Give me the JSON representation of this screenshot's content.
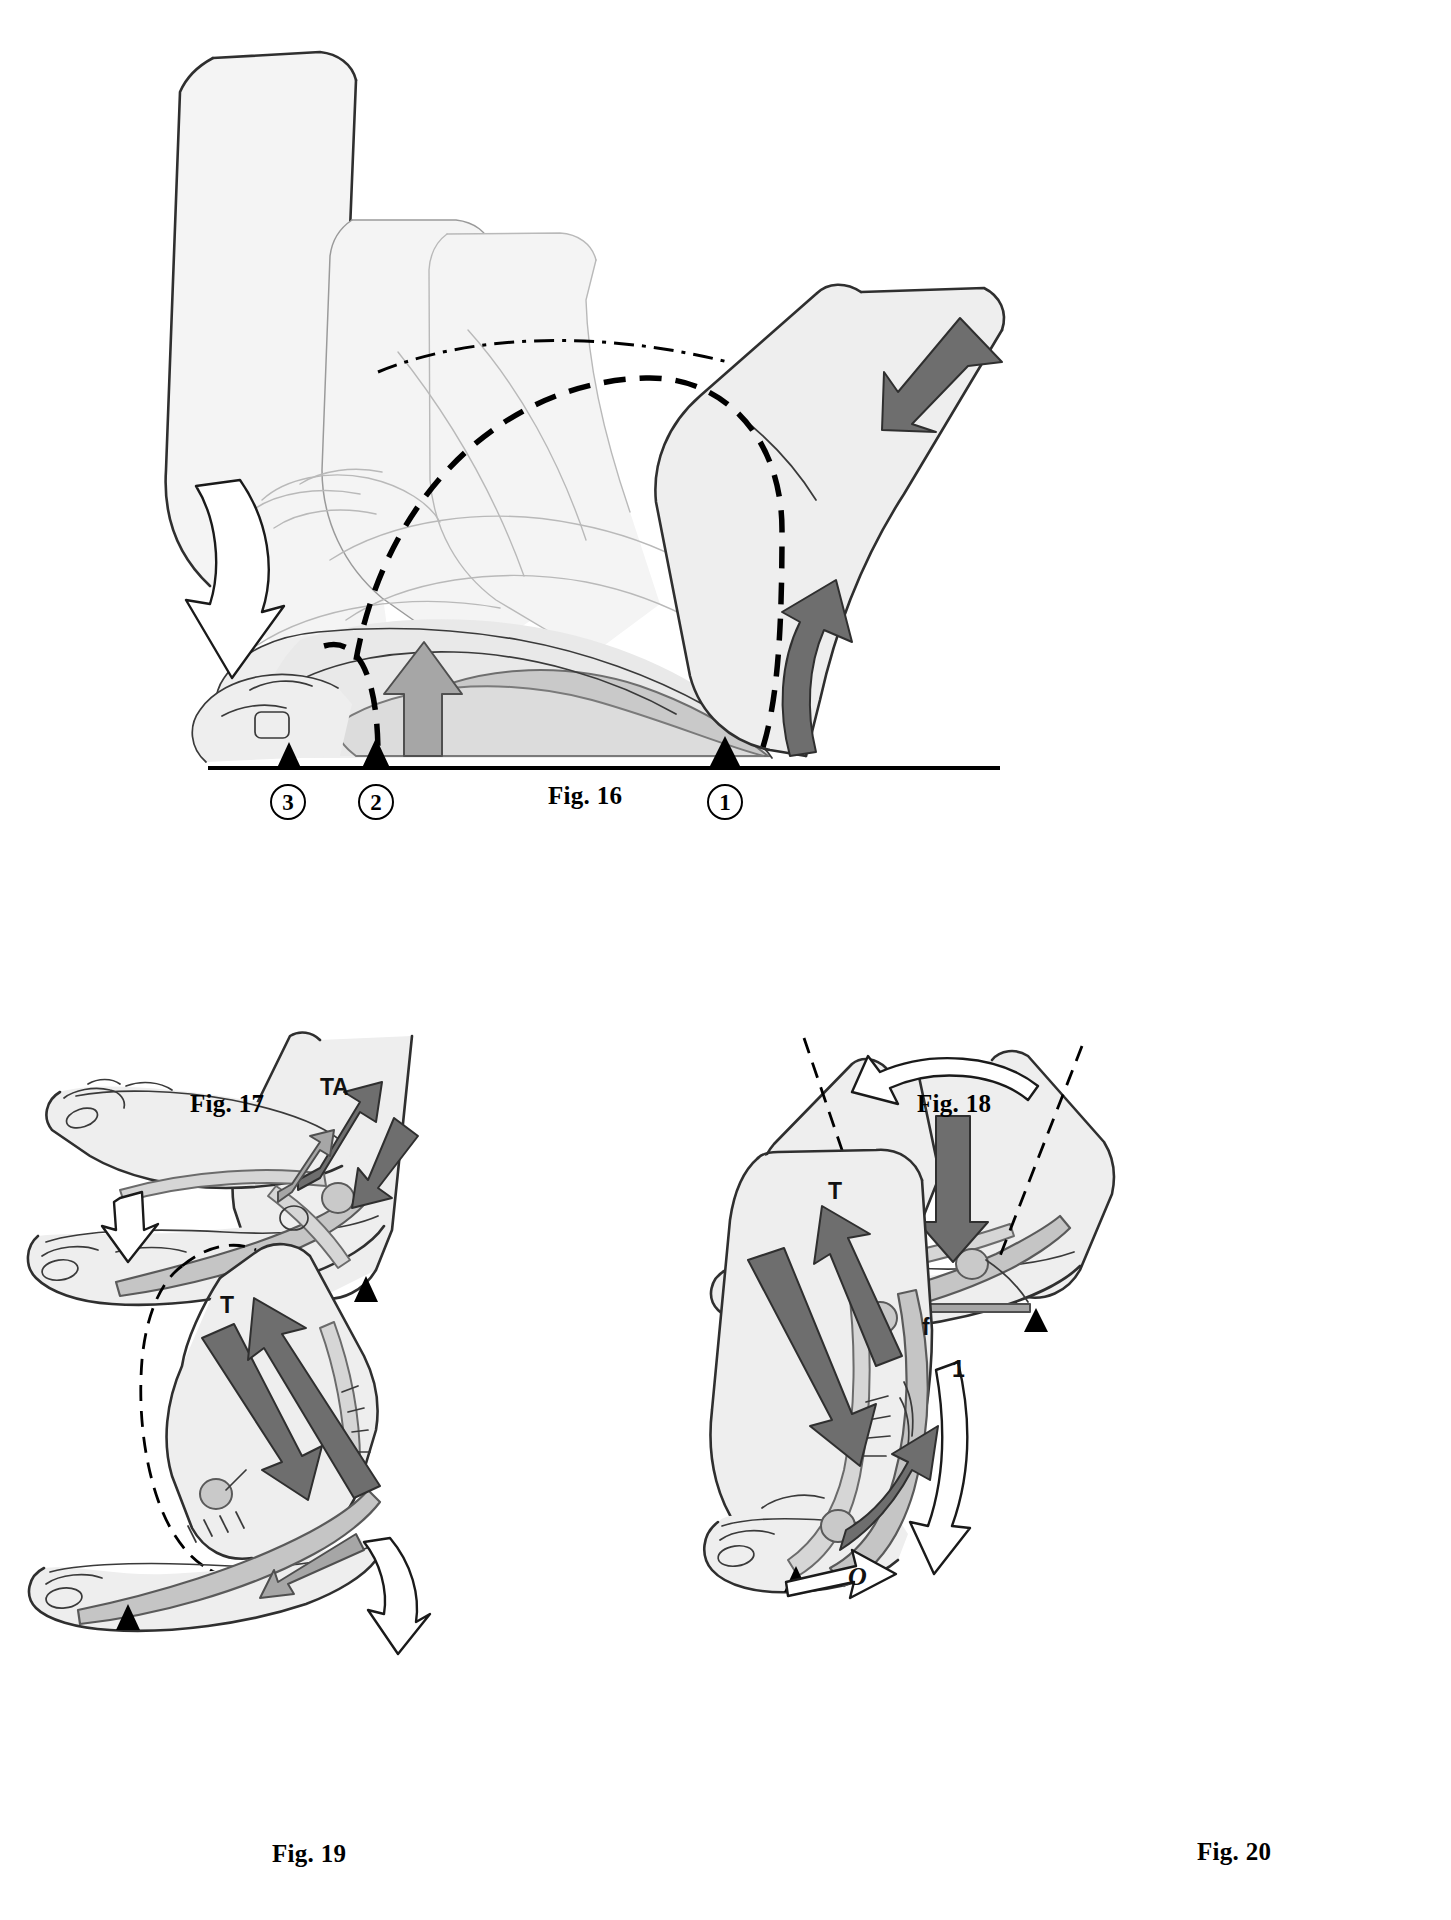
{
  "plate": {
    "title": "Foot and ankle biomechanics figure plate",
    "background_color": "#ffffff",
    "accent_dark": "#6e6e6e",
    "accent_mid": "#a6a6a6",
    "ink": "#000000"
  },
  "figures": [
    {
      "id": "fig16",
      "caption": "Fig. 16",
      "description": "Sagittal view of the foot rolling through stance with three superimposed leg positions, dashed rotation arcs and three ground contact markers",
      "ground_markers": [
        {
          "label": "3",
          "position": "forefoot-toes"
        },
        {
          "label": "2",
          "position": "metatarsal-heads"
        },
        {
          "label": "1",
          "position": "heel"
        }
      ],
      "arrows": [
        {
          "name": "plantarflexion-hollow-arrow",
          "style": "hollow",
          "direction": "down-left"
        },
        {
          "name": "tibial-advance-dark-arrow",
          "style": "dark",
          "direction": "down-left"
        },
        {
          "name": "heel-rise-dark-arrow",
          "style": "dark",
          "direction": "up"
        },
        {
          "name": "arch-lift-mid-arrow",
          "style": "mid",
          "direction": "up"
        }
      ],
      "arcs": [
        {
          "name": "upper-rotation-arc",
          "style": "dash-dot"
        },
        {
          "name": "lower-rotation-arc",
          "style": "dashed"
        },
        {
          "name": "forefoot-rotation-arc",
          "style": "dashed"
        }
      ]
    },
    {
      "id": "fig17",
      "caption": "Fig. 17",
      "description": "Foot in dorsiflexion with tibialis anterior traction, arch tie shown, hollow arrow at forefoot",
      "labels": [
        {
          "text": "TA",
          "name": "tibialis-anterior-label"
        }
      ],
      "ground_markers": [
        {
          "label": "",
          "position": "heel"
        }
      ],
      "arrows": [
        {
          "name": "tibialis-anterior-pull-arrow",
          "style": "dark",
          "direction": "up-right"
        },
        {
          "name": "tibialis-anterior-reaction-arrow",
          "style": "dark",
          "direction": "down-right"
        },
        {
          "name": "arch-tension-arrow",
          "style": "mid",
          "direction": "up-right"
        },
        {
          "name": "forefoot-descent-arrow",
          "style": "hollow",
          "direction": "down"
        }
      ]
    },
    {
      "id": "fig18",
      "caption": "Fig. 18",
      "description": "Two superimposed leg positions with dash-dot axes, body-weight load arrow descending onto talus, splay arrows at the sole",
      "labels": [],
      "ground_markers": [
        {
          "label": "",
          "position": "forefoot"
        },
        {
          "label": "",
          "position": "heel"
        }
      ],
      "arrows": [
        {
          "name": "leg-rotation-hollow-arrow",
          "style": "hollow",
          "direction": "curved-left"
        },
        {
          "name": "body-weight-load-arrow",
          "style": "dark",
          "direction": "down"
        },
        {
          "name": "arch-support-arrow",
          "style": "mid",
          "direction": "up"
        },
        {
          "name": "forefoot-splay-arrow",
          "style": "mid",
          "direction": "left-right"
        },
        {
          "name": "heel-splay-arrow",
          "style": "mid",
          "direction": "left"
        }
      ],
      "axes": [
        {
          "name": "leg-axis-left",
          "style": "dash-dot"
        },
        {
          "name": "leg-axis-right",
          "style": "dash-dot"
        }
      ]
    },
    {
      "id": "fig19",
      "caption": "Fig. 19",
      "description": "Heel-rise phase, triceps surae traction arrow T with dashed outline of the previous leg position and hollow rotation arrow behind the heel",
      "labels": [
        {
          "text": "T",
          "name": "triceps-surae-label"
        }
      ],
      "ground_markers": [
        {
          "label": "",
          "position": "forefoot"
        }
      ],
      "arrows": [
        {
          "name": "triceps-surae-pull-arrow",
          "style": "dark",
          "direction": "down-right"
        },
        {
          "name": "achilles-tension-arrow",
          "style": "dark",
          "direction": "up-right"
        },
        {
          "name": "plantar-aponeurosis-arrow",
          "style": "mid",
          "direction": "left"
        },
        {
          "name": "heel-rotation-hollow-arrow",
          "style": "hollow",
          "direction": "curved-up"
        }
      ],
      "outlines": [
        {
          "name": "previous-position-outline",
          "style": "dashed"
        }
      ]
    },
    {
      "id": "fig20",
      "caption": "Fig. 20",
      "description": "Full tip-toe push-off, triceps surae traction T, toe flexion f, rotation markers 1 and O",
      "labels": [
        {
          "text": "T",
          "name": "triceps-surae-label"
        },
        {
          "text": "f",
          "name": "flexor-force-label"
        },
        {
          "text": "1",
          "name": "rotation-one-label"
        },
        {
          "text": "O",
          "name": "toe-pivot-label"
        }
      ],
      "ground_markers": [
        {
          "label": "",
          "position": "toe"
        }
      ],
      "arrows": [
        {
          "name": "triceps-surae-pull-arrow",
          "style": "dark",
          "direction": "down-right"
        },
        {
          "name": "achilles-tension-arrow",
          "style": "dark",
          "direction": "up-right"
        },
        {
          "name": "calcaneal-rise-arrow",
          "style": "dark",
          "direction": "up-right"
        },
        {
          "name": "heel-rotation-hollow-arrow",
          "style": "hollow",
          "direction": "curved-up"
        },
        {
          "name": "toe-pivot-hollow-arrow",
          "style": "hollow",
          "direction": "right"
        }
      ]
    }
  ]
}
